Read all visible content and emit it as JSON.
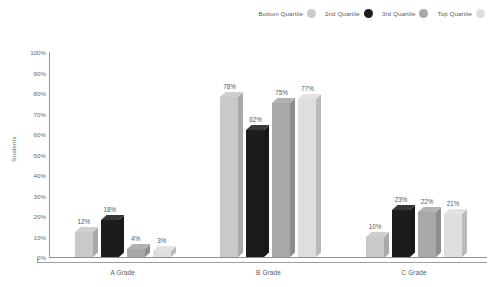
{
  "chart_data": {
    "type": "bar",
    "title": "",
    "xlabel": "",
    "ylabel": "Students",
    "categories": [
      "A Grade",
      "B Grade",
      "C Grade"
    ],
    "series": [
      {
        "name": "Bottom Quartile",
        "color": "#c9c9c9",
        "values": [
          12,
          78,
          10
        ]
      },
      {
        "name": "2nd Quartile",
        "color": "#1c1c1c",
        "values": [
          18,
          62,
          23
        ]
      },
      {
        "name": "3rd Quartile",
        "color": "#a8a8a8",
        "values": [
          4,
          75,
          22
        ]
      },
      {
        "name": "Top Quartile",
        "color": "#dedede",
        "values": [
          3,
          77,
          21
        ]
      }
    ],
    "value_suffix": "%",
    "ylim": [
      0,
      100
    ],
    "ytick_labels": [
      "100%",
      "90%",
      "80%",
      "70%",
      "60%",
      "50%",
      "40%",
      "30%",
      "20%",
      "10%",
      "0%"
    ],
    "ytick_values": [
      100,
      90,
      80,
      70,
      60,
      50,
      40,
      30,
      20,
      10,
      0
    ],
    "grid": false,
    "legend_position": "top-right",
    "style": "3d-column"
  }
}
